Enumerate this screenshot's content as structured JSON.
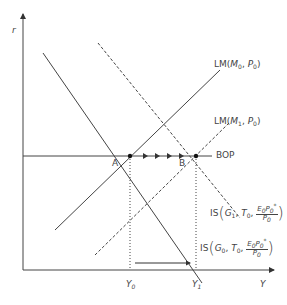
{
  "axes": {
    "y_label": "r",
    "x_label": "Y"
  },
  "curves": {
    "lm0": {
      "label_main": "LM",
      "arg1": "M",
      "arg1_sub": "0",
      "arg2": "P",
      "arg2_sub": "0"
    },
    "lm1": {
      "label_main": "LM",
      "arg1": "M",
      "arg1_sub": "1",
      "arg2": "P",
      "arg2_sub": "0"
    },
    "bop": {
      "label": "BOP"
    },
    "is1": {
      "label_main": "IS",
      "g": "G",
      "g_sub": "1",
      "t": "T",
      "t_sub": "0",
      "num_e": "E",
      "num_e_sub": "0",
      "num_p": "P",
      "num_p_sub": "0",
      "num_star": "*",
      "den": "P",
      "den_sub": "0"
    },
    "is0": {
      "label_main": "IS",
      "g": "G",
      "g_sub": "0",
      "t": "T",
      "t_sub": "0",
      "num_e": "E",
      "num_e_sub": "0",
      "num_p": "P",
      "num_p_sub": "0",
      "num_star": "*",
      "den": "P",
      "den_sub": "0"
    }
  },
  "points": {
    "a": "A",
    "b": "B"
  },
  "ticks": {
    "y0": "Y",
    "y0_sub": "0",
    "y1": "Y",
    "y1_sub": "1"
  },
  "colors": {
    "line": "#444444",
    "text": "#444444"
  }
}
